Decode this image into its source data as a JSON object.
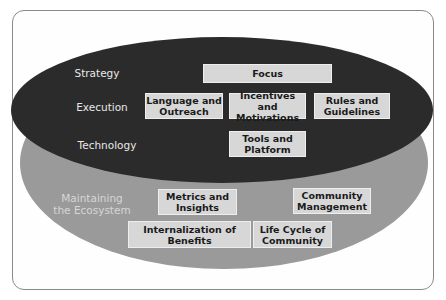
{
  "colors": {
    "top_layer": "#2b2b2b",
    "bottom_layer": "#9a9a9a",
    "box_fill": "#d7d7d7",
    "label_text": "#e8e8e8"
  },
  "layers": {
    "top": {
      "rows": [
        {
          "label": "Strategy"
        },
        {
          "label": "Execution"
        },
        {
          "label": "Technology"
        }
      ]
    },
    "bottom": {
      "label": "Maintaining the Ecosystem"
    }
  },
  "boxes": {
    "focus": "Focus",
    "language": "Language and Outreach",
    "incentives": "Incentives and Motivations",
    "rules": "Rules and Guidelines",
    "tools": "Tools and Platform",
    "metrics": "Metrics and Insights",
    "community_mgmt": "Community Management",
    "internalization": "Internalization of Benefits",
    "life_cycle": "Life Cycle of Community"
  }
}
